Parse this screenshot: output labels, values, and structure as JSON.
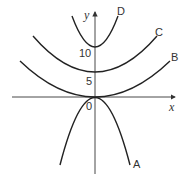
{
  "axes": {
    "x_label": "x",
    "y_label": "y",
    "origin_label": "0",
    "y_ticks": [
      "5",
      "10"
    ]
  },
  "curves": [
    {
      "label": "A",
      "vertex_y": 0,
      "direction": "down"
    },
    {
      "label": "B",
      "vertex_y": 0,
      "direction": "up"
    },
    {
      "label": "C",
      "vertex_y": 5,
      "direction": "up"
    },
    {
      "label": "D",
      "vertex_y": 10,
      "direction": "up"
    }
  ]
}
